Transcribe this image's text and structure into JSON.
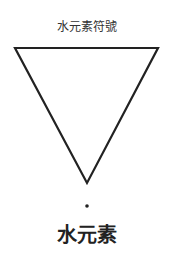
{
  "diagram": {
    "title": "水元素符號",
    "symbol": {
      "shape": "inverted-triangle",
      "stroke_color": "#222222",
      "has_dot_below": true
    },
    "label": "水元素"
  }
}
